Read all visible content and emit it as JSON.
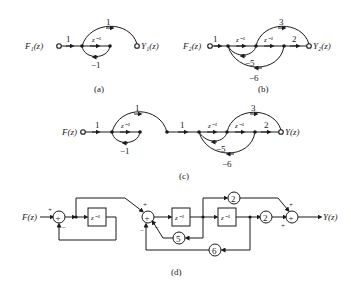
{
  "diagram": {
    "a": {
      "caption": "(a)",
      "input": "F₁(z)",
      "output": "Y₁(z)",
      "gains": {
        "in": "1",
        "delay": "z⁻¹",
        "feedback": "−1",
        "forward": "1"
      }
    },
    "b": {
      "caption": "(b)",
      "input": "F₂(z)",
      "output": "Y₂(z)",
      "gains": {
        "in": "1",
        "delay1": "z⁻¹",
        "delay2": "z⁻¹",
        "out": "2",
        "forward": "3",
        "fb1": "−5",
        "fb2": "−6"
      }
    },
    "c": {
      "caption": "(c)",
      "input": "F(z)",
      "output": "Y(z)",
      "gains": {
        "in": "1",
        "delayA": "z⁻¹",
        "fbA": "−1",
        "fwdA": "1",
        "link": "1",
        "delay1": "z⁻¹",
        "delay2": "z⁻¹",
        "out": "2",
        "forward": "3",
        "fb1": "−5",
        "fb2": "−6"
      }
    },
    "d": {
      "caption": "(d)",
      "input": "F(z)",
      "output": "Y(z)",
      "adder": "+",
      "delay": "z⁻¹",
      "gains": {
        "g2top": "2",
        "g2out": "2",
        "g5": "5",
        "g6": "6"
      },
      "signs": {
        "plus": "+",
        "minus": "−"
      }
    }
  }
}
